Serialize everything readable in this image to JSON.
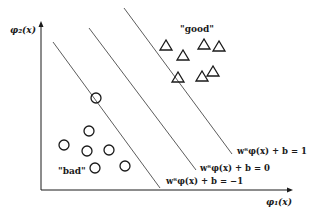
{
  "axes": {
    "x_label": "φ₁(x)",
    "y_label": "φ₂(x)"
  },
  "classes": {
    "positive_label": "\"good\"",
    "negative_label": "\"bad\""
  },
  "hyperplanes": [
    {
      "label": "wᵀφ(x) + b = 1",
      "value": 1
    },
    {
      "label": "wᵀφ(x) + b = 0",
      "value": 0
    },
    {
      "label": "wᵀφ(x) + b = −1",
      "value": -1
    }
  ],
  "colors": {
    "stroke": "#1a1a1a",
    "line": "#4a4a4a",
    "background": "#ffffff"
  },
  "points": {
    "good_triangles": [
      [
        166,
        46
      ],
      [
        183,
        56
      ],
      [
        204,
        45
      ],
      [
        219,
        47
      ],
      [
        213,
        72
      ],
      [
        202,
        77
      ],
      [
        178,
        78
      ]
    ],
    "bad_circles": [
      [
        96,
        98
      ],
      [
        89,
        131
      ],
      [
        64,
        145
      ],
      [
        87,
        151
      ],
      [
        109,
        150
      ],
      [
        95,
        168
      ],
      [
        125,
        166
      ]
    ]
  }
}
